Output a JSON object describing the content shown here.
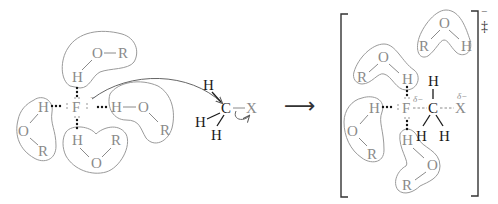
{
  "diagram": {
    "reactant_solvated_nucleophile": {
      "center": "F",
      "charge": "−",
      "solvent_molecules": [
        {
          "h": "H",
          "o": "O",
          "r": "R",
          "position": "top"
        },
        {
          "h": "H",
          "o": "O",
          "r": "R",
          "position": "left"
        },
        {
          "h": "H",
          "o": "O",
          "r": "R",
          "position": "bottom"
        },
        {
          "h": "H",
          "o": "O",
          "r": "R",
          "position": "right"
        }
      ]
    },
    "substrate": {
      "carbon": "C",
      "hydrogens": [
        "H",
        "H",
        "H"
      ],
      "leaving_group": "X"
    },
    "reaction_arrow": "⟶",
    "transition_state": {
      "nucleophile": "F",
      "nucleophile_partial_charge": "δ−",
      "carbon": "C",
      "hydrogens": [
        "H",
        "H",
        "H"
      ],
      "leaving_group": "X",
      "leaving_group_partial_charge": "δ−",
      "overall_charge": "−",
      "ts_symbol": "‡",
      "solvent_molecules": [
        {
          "h": "H",
          "o": "O",
          "r": "R",
          "position": "top-right-free"
        },
        {
          "h": "H",
          "o": "O",
          "r": "R",
          "position": "top"
        },
        {
          "h": "H",
          "o": "O",
          "r": "R",
          "position": "left"
        },
        {
          "h": "H",
          "o": "O",
          "r": "R",
          "position": "bottom"
        }
      ]
    },
    "colors": {
      "solvent_gray": "#8a8a8a",
      "substrate_black": "#1a1a1a",
      "outline": "#9a9a9a"
    }
  }
}
